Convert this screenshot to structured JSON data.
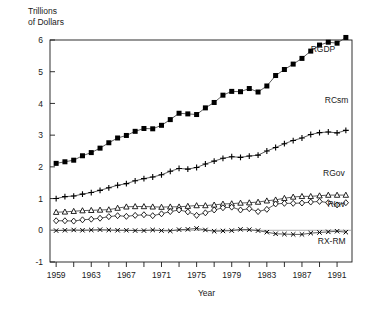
{
  "chart_data": {
    "type": "line",
    "title": "",
    "xlabel": "Year",
    "ylabel": "Trillions\nof Dollars",
    "xlim": [
      1958.3,
      1992.7
    ],
    "ylim": [
      -1,
      6
    ],
    "yticks": [
      -1,
      0,
      1,
      2,
      3,
      4,
      5,
      6
    ],
    "ytick_labels": [
      "-1",
      "0",
      "1",
      "2",
      "3",
      "4",
      "5",
      "6"
    ],
    "xticks": [
      1959,
      1961,
      1963,
      1965,
      1967,
      1969,
      1971,
      1973,
      1975,
      1977,
      1979,
      1981,
      1983,
      1985,
      1987,
      1989,
      1991
    ],
    "xtick_labels": [
      "1959",
      "",
      "1963",
      "",
      "1967",
      "",
      "1971",
      "",
      "1975",
      "",
      "1979",
      "",
      "1983",
      "",
      "1987",
      "",
      "1991"
    ],
    "grid": false,
    "legend_position": "inline-right",
    "x": [
      1959,
      1960,
      1961,
      1962,
      1963,
      1964,
      1965,
      1966,
      1967,
      1968,
      1969,
      1970,
      1971,
      1972,
      1973,
      1974,
      1975,
      1976,
      1977,
      1978,
      1979,
      1980,
      1981,
      1982,
      1983,
      1984,
      1985,
      1986,
      1987,
      1988,
      1989,
      1990,
      1991,
      1992
    ],
    "series": [
      {
        "name": "RGDP",
        "marker": "filled-square",
        "values": [
          2.11,
          2.16,
          2.21,
          2.35,
          2.45,
          2.59,
          2.76,
          2.91,
          2.99,
          3.12,
          3.21,
          3.2,
          3.31,
          3.49,
          3.69,
          3.67,
          3.65,
          3.86,
          4.03,
          4.26,
          4.38,
          4.37,
          4.47,
          4.36,
          4.55,
          4.88,
          5.07,
          5.24,
          5.42,
          5.65,
          5.84,
          5.93,
          5.9,
          6.08
        ]
      },
      {
        "name": "RCsm",
        "marker": "plus",
        "values": [
          1.0,
          1.06,
          1.08,
          1.14,
          1.19,
          1.26,
          1.34,
          1.42,
          1.47,
          1.56,
          1.63,
          1.68,
          1.75,
          1.86,
          1.95,
          1.93,
          1.98,
          2.09,
          2.18,
          2.27,
          2.32,
          2.3,
          2.34,
          2.37,
          2.5,
          2.61,
          2.73,
          2.83,
          2.91,
          3.02,
          3.08,
          3.1,
          3.07,
          3.15
        ]
      },
      {
        "name": "RGov",
        "marker": "triangle",
        "values": [
          0.57,
          0.58,
          0.6,
          0.62,
          0.63,
          0.64,
          0.65,
          0.7,
          0.74,
          0.75,
          0.75,
          0.74,
          0.73,
          0.74,
          0.74,
          0.76,
          0.78,
          0.78,
          0.8,
          0.83,
          0.84,
          0.86,
          0.87,
          0.89,
          0.93,
          0.96,
          1.01,
          1.05,
          1.07,
          1.07,
          1.09,
          1.11,
          1.11,
          1.11
        ]
      },
      {
        "name": "RInv",
        "marker": "diamond",
        "values": [
          0.3,
          0.3,
          0.29,
          0.33,
          0.35,
          0.38,
          0.43,
          0.46,
          0.44,
          0.47,
          0.49,
          0.46,
          0.52,
          0.59,
          0.64,
          0.58,
          0.47,
          0.55,
          0.64,
          0.71,
          0.73,
          0.64,
          0.68,
          0.59,
          0.66,
          0.83,
          0.85,
          0.85,
          0.86,
          0.89,
          0.91,
          0.87,
          0.8,
          0.87
        ]
      },
      {
        "name": "RX-RM",
        "marker": "x",
        "values": [
          -0.01,
          0.0,
          0.01,
          0.0,
          0.01,
          0.02,
          0.01,
          0.0,
          0.0,
          -0.01,
          -0.01,
          0.01,
          -0.01,
          -0.02,
          0.02,
          0.03,
          0.06,
          0.01,
          -0.03,
          -0.02,
          -0.01,
          0.03,
          0.02,
          -0.01,
          -0.06,
          -0.11,
          -0.12,
          -0.13,
          -0.13,
          -0.09,
          -0.07,
          -0.05,
          -0.03,
          -0.06
        ]
      }
    ],
    "series_label_positions": [
      {
        "name": "RGDP",
        "x": 1988.0,
        "y": 5.62
      },
      {
        "name": "RCsm",
        "x": 1989.6,
        "y": 4.02
      },
      {
        "name": "RGov",
        "x": 1989.4,
        "y": 1.72
      },
      {
        "name": "RInv",
        "x": 1989.9,
        "y": 0.72
      },
      {
        "name": "RX-RM",
        "x": 1988.8,
        "y": -0.42
      }
    ]
  },
  "colors": {
    "axis": "#1a1a1a",
    "line": "#333333",
    "marker": "#000000",
    "background": "#ffffff"
  }
}
